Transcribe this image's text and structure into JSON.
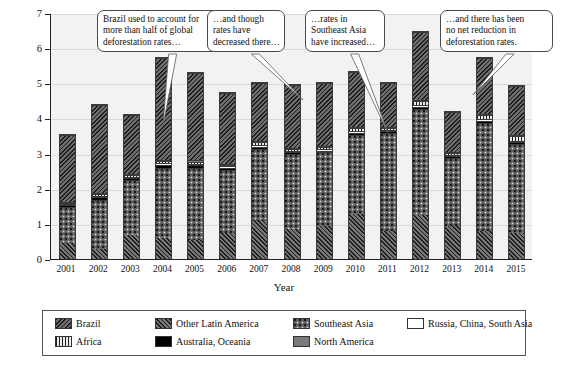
{
  "chart_data": {
    "type": "bar",
    "title": "",
    "subtitle": "",
    "xlabel": "Year",
    "ylabel": "Deforestation (Mha)",
    "ylim": [
      0,
      7
    ],
    "yticks": [
      0,
      1,
      2,
      3,
      4,
      5,
      6,
      7
    ],
    "ytick_labels": [
      "0",
      "1",
      "2",
      "3",
      "4",
      "5",
      "6",
      "7"
    ],
    "grid": true,
    "stacked": true,
    "legend_position": "below-plot",
    "categories": [
      "2001",
      "2002",
      "2003",
      "2004",
      "2005",
      "2006",
      "2007",
      "2008",
      "2009",
      "2010",
      "2011",
      "2012",
      "2013",
      "2014",
      "2015"
    ],
    "series": [
      {
        "name": "Other Latin America",
        "key": "otherlatin",
        "values": [
          0.45,
          0.3,
          0.7,
          0.6,
          0.55,
          0.75,
          1.1,
          0.85,
          0.95,
          1.3,
          0.8,
          1.25,
          0.95,
          0.8,
          0.75
        ]
      },
      {
        "name": "Southeast Asia",
        "key": "seasia",
        "values": [
          1.05,
          1.4,
          1.55,
          2.0,
          2.05,
          1.8,
          2.05,
          2.15,
          2.1,
          2.25,
          2.8,
          3.05,
          1.95,
          3.1,
          2.55
        ]
      },
      {
        "name": "Australia, Oceania",
        "key": "australia",
        "values": [
          0.05,
          0.07,
          0.07,
          0.09,
          0.08,
          0.06,
          0.06,
          0.05,
          0.05,
          0.06,
          0.05,
          0.05,
          0.04,
          0.06,
          0.05
        ]
      },
      {
        "name": "Russia, China, South Asia",
        "key": "russia",
        "values": [
          0.03,
          0.04,
          0.04,
          0.05,
          0.05,
          0.04,
          0.05,
          0.04,
          0.04,
          0.05,
          0.04,
          0.05,
          0.04,
          0.05,
          0.04
        ]
      },
      {
        "name": "Africa",
        "key": "africa",
        "values": [
          0.04,
          0.06,
          0.05,
          0.06,
          0.06,
          0.05,
          0.08,
          0.07,
          0.07,
          0.09,
          0.07,
          0.12,
          0.06,
          0.11,
          0.14
        ]
      },
      {
        "name": "North America",
        "key": "northam",
        "values": [
          0.03,
          0.03,
          0.03,
          0.03,
          0.03,
          0.03,
          0.03,
          0.03,
          0.03,
          0.03,
          0.03,
          0.03,
          0.03,
          0.03,
          0.03
        ]
      },
      {
        "name": "Brazil",
        "key": "brazil",
        "values": [
          1.9,
          2.5,
          1.7,
          2.92,
          2.5,
          2.03,
          1.68,
          1.78,
          1.8,
          1.57,
          1.26,
          1.95,
          1.15,
          1.6,
          1.4
        ]
      }
    ],
    "totals": [
      3.55,
      4.4,
      4.14,
      5.75,
      5.32,
      4.76,
      5.05,
      4.97,
      5.04,
      5.35,
      5.05,
      6.5,
      4.22,
      5.75,
      4.96
    ],
    "segment_order_bottom_to_top": [
      "otherlatin",
      "seasia",
      "australia",
      "russia",
      "africa",
      "northam",
      "brazil"
    ]
  },
  "legend": {
    "items": [
      {
        "label": "Brazil",
        "key": "brazil"
      },
      {
        "label": "Other Latin America",
        "key": "otherlatin"
      },
      {
        "label": "Southeast Asia",
        "key": "seasia"
      },
      {
        "label": "Russia, China, South Asia",
        "key": "russia"
      },
      {
        "label": "Africa",
        "key": "africa"
      },
      {
        "label": "Australia, Oceania",
        "key": "australia"
      },
      {
        "label": "North America",
        "key": "northam"
      }
    ]
  },
  "callouts": [
    {
      "id": "callout-brazil-share",
      "lines": [
        "Brazil used to account for",
        "more than half of global",
        "deforestation rates…"
      ]
    },
    {
      "id": "callout-rates-decreased",
      "lines": [
        "…and though",
        "rates have",
        "decreased there…"
      ]
    },
    {
      "id": "callout-southeast-asia",
      "lines": [
        "…rates in",
        "Southeast Asia",
        "have increased…"
      ]
    },
    {
      "id": "callout-no-net-reduction",
      "lines": [
        "…and there has been",
        "no net reduction in",
        "deforestation rates."
      ]
    }
  ],
  "colors": {
    "plot_background": "#f2f2f2",
    "gridline": "#d9d9d9",
    "axis": "#222222",
    "bar_outline": "#3a3a3a",
    "callout_border": "#4a4a4a",
    "legend_border": "#555555"
  }
}
